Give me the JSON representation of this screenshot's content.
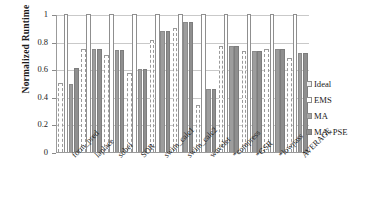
{
  "chart_data": {
    "type": "bar",
    "title": "",
    "xlabel": "",
    "ylabel": "Normalized Runtime",
    "ylim": [
      0,
      1
    ],
    "yticks": [
      "0",
      "0.2",
      "0.4",
      "0.6",
      "0.8",
      "1"
    ],
    "grid": true,
    "legend_position": "right",
    "categories": [
      "form_pred",
      "laplace",
      "sobel",
      "SOR",
      "swim_calc1",
      "swim_calc2",
      "wavelet",
      "*compress",
      "*GSR",
      "*lowpass",
      "AVERAGE"
    ],
    "series": [
      {
        "name": "Ideal",
        "values": [
          0.5,
          0.745,
          0.7,
          0.57,
          0.815,
          0.9,
          0.34,
          0.77,
          0.73,
          0.745,
          0.68
        ]
      },
      {
        "name": "EMS",
        "values": [
          1.0,
          1.0,
          1.0,
          1.0,
          1.0,
          1.0,
          1.0,
          1.0,
          1.0,
          1.0,
          1.0
        ]
      },
      {
        "name": "MA",
        "values": [
          0.49,
          0.75,
          0.74,
          0.6,
          0.875,
          0.94,
          0.46,
          0.77,
          0.73,
          0.75,
          0.72
        ]
      },
      {
        "name": "MA+PSE",
        "values": [
          0.61,
          0.75,
          0.74,
          0.6,
          0.875,
          0.94,
          0.46,
          0.77,
          0.73,
          0.75,
          0.72
        ]
      }
    ]
  },
  "legend": {
    "items": [
      {
        "label": "Ideal",
        "swatch": "ideal-swatch"
      },
      {
        "label": "EMS",
        "swatch": "ems-swatch"
      },
      {
        "label": "MA",
        "swatch": "ma-swatch"
      },
      {
        "label": "MA+PSE",
        "swatch": "ma-pse-swatch"
      }
    ]
  },
  "colors": {
    "ideal": "#ffffff",
    "ems": "#ffffff",
    "ma": "#9d9d9d",
    "ma_pse": "#8f8f8f",
    "grid": "#c9c9c9",
    "axis": "#9b9b9b"
  }
}
